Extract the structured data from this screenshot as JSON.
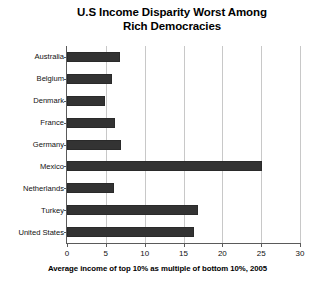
{
  "chart_data": {
    "type": "bar",
    "orientation": "horizontal",
    "title": "U.S Income Disparity Worst Among Rich Democracies",
    "title_lines": [
      "U.S Income Disparity Worst Among",
      "Rich Democracies"
    ],
    "categories": [
      "Australia",
      "Belgium",
      "Denmark",
      "France",
      "Germany",
      "Mexico",
      "Netherlands",
      "Turkey",
      "United States"
    ],
    "values": [
      6.8,
      5.8,
      4.9,
      6.2,
      6.9,
      25.1,
      6.0,
      16.9,
      16.3
    ],
    "xlabel": "Average income of top 10% as multiple of bottom 10%, 2005",
    "ylabel": "",
    "xlim": [
      0,
      30
    ],
    "xticks": [
      0,
      5,
      10,
      15,
      20,
      25,
      30
    ],
    "xtick_labels": [
      "0",
      "5",
      "10",
      "15",
      "20",
      "25",
      "30"
    ],
    "grid": "vertical",
    "legend": "none",
    "bar_color": "#333333",
    "grid_color": "#c8c8c8",
    "axis_color": "#5a5a5a",
    "background_color": "#ffffff"
  }
}
